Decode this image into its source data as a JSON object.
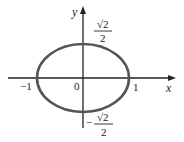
{
  "diagram": {
    "type": "ellipse-on-axes",
    "equation": "x^2 + 2y^2 = 1",
    "axes": {
      "x_label": "x",
      "y_label": "y",
      "origin_label": "0"
    },
    "ticks": {
      "x_neg": "−1",
      "x_pos": "1",
      "y_pos_num": "√2",
      "y_pos_den": "2",
      "y_neg_sign": "−",
      "y_neg_num": "√2",
      "y_neg_den": "2"
    },
    "ellipse": {
      "semi_major_x": 1,
      "semi_minor_y": "√2/2",
      "stroke_color": "#555555"
    },
    "axis_color": "#222222"
  }
}
